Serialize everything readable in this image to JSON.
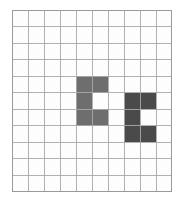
{
  "figure": {
    "title": "",
    "caption_fragment": "",
    "background_color": "#ffffff"
  },
  "grid": {
    "columns": 10,
    "rows": 11,
    "cell_width": 16,
    "cell_height": 16.55,
    "line_color": "#a9a9a9",
    "border_color": "#9a9a9a",
    "cell_fill": "#fdfdfd",
    "origin_x": 12,
    "origin_y": 10
  },
  "shapes": [
    {
      "name": "left-shape",
      "color": "#6e6e6e",
      "cells": [
        {
          "col": 4,
          "row": 4
        },
        {
          "col": 5,
          "row": 4
        },
        {
          "col": 4,
          "row": 5
        },
        {
          "col": 4,
          "row": 6
        },
        {
          "col": 5,
          "row": 6
        }
      ]
    },
    {
      "name": "right-shape",
      "color": "#4a4a4a",
      "cells": [
        {
          "col": 7,
          "row": 5
        },
        {
          "col": 8,
          "row": 5
        },
        {
          "col": 7,
          "row": 6
        },
        {
          "col": 7,
          "row": 7
        },
        {
          "col": 8,
          "row": 7
        }
      ]
    }
  ]
}
